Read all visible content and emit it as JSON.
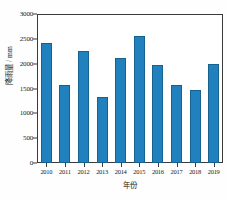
{
  "chart_data": {
    "type": "bar",
    "title": "",
    "xlabel": "年份",
    "ylabel": "降雨量 / mm",
    "categories": [
      "2010",
      "2011",
      "2012",
      "2013",
      "2014",
      "2015",
      "2016",
      "2017",
      "2018",
      "2019"
    ],
    "values": [
      2415,
      1570,
      2255,
      1330,
      2115,
      2560,
      1975,
      1570,
      1470,
      1990
    ],
    "ylim": [
      0,
      3000
    ],
    "yticks": [
      0,
      500,
      1000,
      1500,
      2000,
      2500,
      3000
    ],
    "ytick_labels": [
      "0",
      "500",
      "1000",
      "1500",
      "2000",
      "2500",
      "3000"
    ],
    "grid": false,
    "legend": "none",
    "bar_color": "#2081be",
    "bar_edge_color": "#15628f",
    "axis_color": "#3a3a3a",
    "background": "#ffffff"
  }
}
